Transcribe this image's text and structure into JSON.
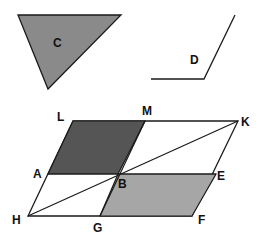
{
  "colors": {
    "background": "#ffffff",
    "stroke": "#1a1a1a",
    "dark_fill": "#555555",
    "medium_fill": "#8a8a8a",
    "light_fill": "#a6a6a6",
    "white_fill": "#ffffff"
  },
  "shapes": {
    "triangle_c": {
      "label": "C",
      "points": "18,15 121,15 48,89",
      "label_pos": [
        53,
        47
      ]
    },
    "angle_d": {
      "label": "D",
      "points": "151,79 204,79 235,15",
      "label_pos": [
        190,
        64
      ]
    },
    "parallelogram": {
      "outline": "73,121 238,121 192,216 28,216",
      "dark_region": "73,121 145,121 118,174 48,174",
      "light_region": "118,174 216,174 192,216 100,216",
      "diagonal": [
        28,
        216,
        238,
        121
      ],
      "segment_AE": [
        48,
        174,
        216,
        174
      ],
      "segment_MG": [
        145,
        121,
        100,
        216
      ]
    }
  },
  "points": [
    {
      "label": "L",
      "pos": [
        57,
        121
      ]
    },
    {
      "label": "M",
      "pos": [
        142,
        115
      ]
    },
    {
      "label": "K",
      "pos": [
        241,
        126
      ]
    },
    {
      "label": "A",
      "pos": [
        33,
        178
      ]
    },
    {
      "label": "B",
      "pos": [
        118,
        188
      ]
    },
    {
      "label": "E",
      "pos": [
        217,
        180
      ]
    },
    {
      "label": "H",
      "pos": [
        12,
        224
      ]
    },
    {
      "label": "G",
      "pos": [
        93,
        232
      ]
    },
    {
      "label": "F",
      "pos": [
        198,
        224
      ]
    }
  ]
}
